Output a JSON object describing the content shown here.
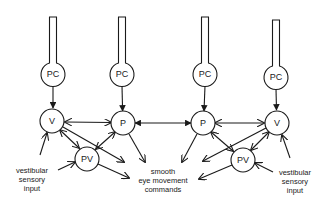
{
  "diagram": {
    "title": "",
    "nodes": [
      {
        "id": "pc1",
        "label": "PC",
        "x": 53,
        "y": 74
      },
      {
        "id": "pc2",
        "label": "PC",
        "x": 122,
        "y": 74
      },
      {
        "id": "pc3",
        "label": "PC",
        "x": 205,
        "y": 74
      },
      {
        "id": "pc4",
        "label": "PC",
        "x": 276,
        "y": 77
      },
      {
        "id": "v1",
        "label": "V",
        "x": 52,
        "y": 121
      },
      {
        "id": "p1",
        "label": "P",
        "x": 123,
        "y": 123
      },
      {
        "id": "p2",
        "label": "P",
        "x": 203,
        "y": 123
      },
      {
        "id": "v2",
        "label": "V",
        "x": 277,
        "y": 123
      },
      {
        "id": "pv1",
        "label": "PV",
        "x": 87,
        "y": 159
      },
      {
        "id": "pv2",
        "label": "PV",
        "x": 243,
        "y": 160
      }
    ],
    "edges": [
      {
        "from": "pc1",
        "to": "v1",
        "type": "inhibitory"
      },
      {
        "from": "pc2",
        "to": "p1",
        "type": "inhibitory"
      },
      {
        "from": "pc3",
        "to": "p2",
        "type": "inhibitory"
      },
      {
        "from": "pc4",
        "to": "v2",
        "type": "inhibitory"
      },
      {
        "from": "v1",
        "to": "p1",
        "type": "bidirectional"
      },
      {
        "from": "p1",
        "to": "p2",
        "type": "bidirectional-inhibitory"
      },
      {
        "from": "p2",
        "to": "v2",
        "type": "bidirectional"
      },
      {
        "from": "v1",
        "to": "pv1",
        "type": "bidirectional"
      },
      {
        "from": "p1",
        "to": "pv1",
        "type": "bidirectional"
      },
      {
        "from": "p2",
        "to": "pv2",
        "type": "bidirectional"
      },
      {
        "from": "v2",
        "to": "pv2",
        "type": "bidirectional"
      },
      {
        "from": "vestibular-left",
        "to": "v1"
      },
      {
        "from": "vestibular-left",
        "to": "pv1"
      },
      {
        "from": "vestibular-right",
        "to": "v2"
      },
      {
        "from": "vestibular-right",
        "to": "pv2"
      },
      {
        "from": "v1",
        "to": "smooth-eye-movement-commands"
      },
      {
        "from": "p1",
        "to": "smooth-eye-movement-commands"
      },
      {
        "from": "pv1",
        "to": "smooth-eye-movement-commands"
      },
      {
        "from": "v2",
        "to": "smooth-eye-movement-commands"
      },
      {
        "from": "p2",
        "to": "smooth-eye-movement-commands"
      },
      {
        "from": "pv2",
        "to": "smooth-eye-movement-commands"
      }
    ]
  },
  "labels": {
    "pc1": "PC",
    "pc2": "PC",
    "pc3": "PC",
    "pc4": "PC",
    "v1": "V",
    "p1": "P",
    "p2": "P",
    "v2": "V",
    "pv1": "PV",
    "pv2": "PV"
  },
  "captions": {
    "left_input": [
      "vestibular",
      "sensory",
      "input"
    ],
    "right_input": [
      "vestibular",
      "sensory",
      "input"
    ],
    "output": [
      "smooth",
      "eye movement",
      "commands"
    ]
  },
  "colors": {
    "ink": "#1a1a1a",
    "background": "#ffffff"
  }
}
